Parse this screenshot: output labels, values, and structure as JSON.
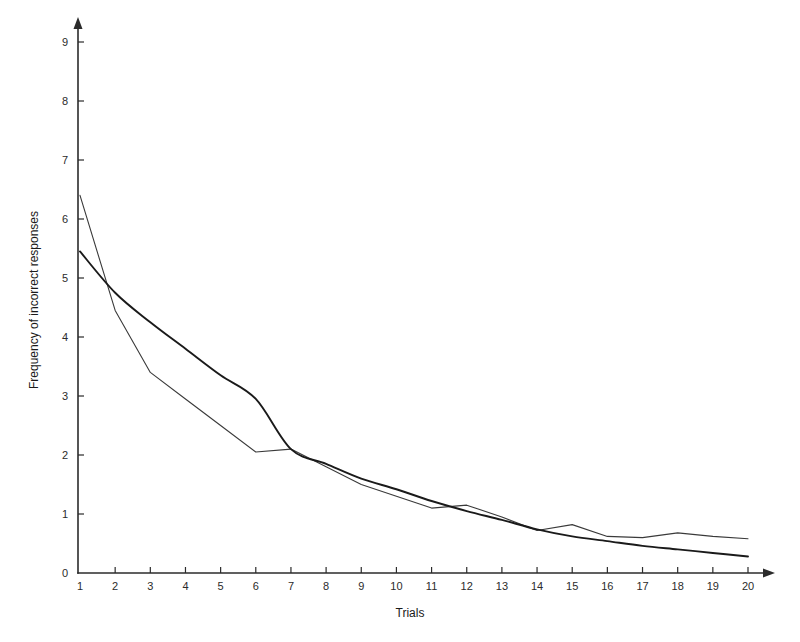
{
  "chart_data": {
    "type": "line",
    "title": "",
    "subtitle": "",
    "xlabel": "Trials",
    "ylabel": "Frequency of incorrect responses",
    "grid": false,
    "legend": "none",
    "xlim": [
      0,
      20
    ],
    "ylim": [
      0,
      9
    ],
    "x": [
      1,
      2,
      3,
      4,
      5,
      6,
      7,
      8,
      9,
      10,
      11,
      12,
      13,
      14,
      15,
      16,
      17,
      18,
      19,
      20
    ],
    "xticks": [
      "1",
      "2",
      "3",
      "4",
      "5",
      "6",
      "7",
      "8",
      "9",
      "10",
      "11",
      "12",
      "13",
      "14",
      "15",
      "16",
      "17",
      "18",
      "19",
      "20"
    ],
    "yticks": [
      "0",
      "1",
      "2",
      "3",
      "4",
      "5",
      "6",
      "7",
      "8",
      "9"
    ],
    "series": [
      {
        "name": "observed",
        "values": [
          6.4,
          4.45,
          3.4,
          2.95,
          2.5,
          2.05,
          2.1,
          1.8,
          1.5,
          1.3,
          1.1,
          1.15,
          0.95,
          0.72,
          0.82,
          0.62,
          0.6,
          0.68,
          0.62,
          0.58
        ]
      },
      {
        "name": "fitted",
        "values": [
          5.45,
          4.75,
          4.25,
          3.8,
          3.35,
          2.95,
          2.1,
          1.85,
          1.6,
          1.42,
          1.22,
          1.05,
          0.9,
          0.74,
          0.62,
          0.54,
          0.46,
          0.4,
          0.34,
          0.28
        ]
      }
    ],
    "annotations": []
  },
  "axes": {
    "y_arrow": "arrow-up",
    "x_arrow": "arrow-right",
    "origin_label": "0"
  }
}
